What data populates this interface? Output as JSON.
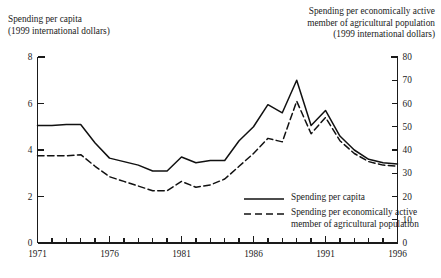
{
  "chart_data": {
    "type": "line",
    "title": "",
    "xlabel": "",
    "ylabel": "Spending per capita (1999 international dollars)",
    "ylabel_right": "Spending per economically active member of agricultural population (1999 international dollars)",
    "grid": false,
    "legend_position": "inside-bottom-right",
    "x": [
      1971,
      1972,
      1973,
      1974,
      1975,
      1976,
      1977,
      1978,
      1979,
      1980,
      1981,
      1982,
      1983,
      1984,
      1985,
      1986,
      1987,
      1988,
      1989,
      1990,
      1991,
      1992,
      1993,
      1994,
      1995,
      1996
    ],
    "xlim": [
      1971,
      1996
    ],
    "ylim": [
      0,
      8
    ],
    "ylim_right": [
      0,
      80
    ],
    "yticks": [
      0,
      2,
      4,
      6,
      8
    ],
    "yticks_right": [
      0,
      10,
      20,
      30,
      40,
      50,
      60,
      70,
      80
    ],
    "xticks_labeled": [
      1971,
      1976,
      1981,
      1986,
      1991,
      1996
    ],
    "series": [
      {
        "name": "Spending per capita",
        "axis": "left",
        "style": "solid",
        "values": [
          5.05,
          5.05,
          5.1,
          5.1,
          4.3,
          3.65,
          3.5,
          3.35,
          3.1,
          3.1,
          3.7,
          3.45,
          3.55,
          3.55,
          4.4,
          5.0,
          5.95,
          5.6,
          7.0,
          5.05,
          5.7,
          4.6,
          4.0,
          3.6,
          3.45,
          3.4
        ]
      },
      {
        "name": "Spending per economically active member of agricultural population",
        "axis": "right",
        "style": "dashed",
        "values": [
          37.5,
          37.5,
          37.5,
          38.0,
          33.0,
          28.5,
          26.5,
          24.5,
          22.5,
          22.5,
          26.5,
          24.0,
          25.0,
          27.5,
          33.0,
          38.5,
          45.0,
          43.5,
          61.0,
          47.0,
          54.0,
          44.0,
          38.5,
          35.0,
          33.5,
          33.0
        ]
      }
    ]
  },
  "captions": {
    "left": "Spending per capita\n(1999 international dollars)",
    "right": "Spending per economically active\nmember of  agricultural population\n(1999 international dollars)"
  },
  "legend": {
    "entries": [
      {
        "label": "Spending per capita",
        "style": "solid"
      },
      {
        "label": "Spending per economically active\nmember of  agricultural population",
        "style": "dashed"
      }
    ]
  },
  "colors": {
    "axis": "#1a1a1a",
    "line": "#111111",
    "background": "#ffffff"
  }
}
